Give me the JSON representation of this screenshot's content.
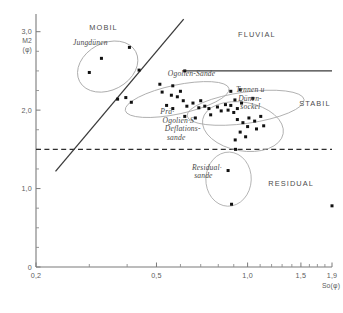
{
  "chart_data": {
    "type": "scatter",
    "title": "",
    "xlabel": "So(φ)",
    "ylabel": "M2 (φ)",
    "xlim": [
      0.2,
      1.9
    ],
    "ylim": [
      0.0,
      3.2
    ],
    "x_scale": "log",
    "grid": false,
    "legend_position": "none",
    "xticks": [
      {
        "value": 0.2,
        "label": "0,2",
        "major": true
      },
      {
        "value": 0.3,
        "label": "",
        "major": false
      },
      {
        "value": 0.4,
        "label": "",
        "major": false
      },
      {
        "value": 0.5,
        "label": "0,5",
        "major": true
      },
      {
        "value": 0.6,
        "label": "",
        "major": false
      },
      {
        "value": 0.7,
        "label": "",
        "major": false
      },
      {
        "value": 0.8,
        "label": "",
        "major": false
      },
      {
        "value": 0.9,
        "label": "",
        "major": false
      },
      {
        "value": 1.0,
        "label": "1,0",
        "major": true
      },
      {
        "value": 1.1,
        "label": "",
        "major": false
      },
      {
        "value": 1.2,
        "label": "",
        "major": false
      },
      {
        "value": 1.3,
        "label": "",
        "major": false
      },
      {
        "value": 1.4,
        "label": "",
        "major": false
      },
      {
        "value": 1.5,
        "label": "1,5",
        "major": true
      },
      {
        "value": 1.6,
        "label": "",
        "major": false
      },
      {
        "value": 1.7,
        "label": "",
        "major": false
      },
      {
        "value": 1.8,
        "label": "",
        "major": false
      },
      {
        "value": 1.9,
        "label": "1,9",
        "major": true
      }
    ],
    "yticks": [
      {
        "value": 0.0,
        "label": "0",
        "major": true
      },
      {
        "value": 0.25,
        "label": "",
        "major": false
      },
      {
        "value": 0.5,
        "label": "",
        "major": false
      },
      {
        "value": 0.75,
        "label": "",
        "major": false
      },
      {
        "value": 1.0,
        "label": "1,0",
        "major": true
      },
      {
        "value": 1.25,
        "label": "",
        "major": false
      },
      {
        "value": 1.5,
        "label": "",
        "major": false
      },
      {
        "value": 1.75,
        "label": "",
        "major": false
      },
      {
        "value": 2.0,
        "label": "2,0",
        "major": true
      },
      {
        "value": 2.25,
        "label": "",
        "major": false
      },
      {
        "value": 2.5,
        "label": "",
        "major": false
      },
      {
        "value": 2.75,
        "label": "",
        "major": false
      },
      {
        "value": 3.0,
        "label": "3,0",
        "major": true
      }
    ],
    "reference_lines": [
      {
        "name": "fluvial-boundary",
        "orientation": "horizontal",
        "style": "solid",
        "y": 2.5,
        "x_start": 0.61,
        "x_end": 1.9
      },
      {
        "name": "residual-boundary",
        "orientation": "horizontal",
        "style": "dashed",
        "y": 1.5,
        "x_start": 0.2,
        "x_end": 1.9
      },
      {
        "name": "mobil-stabil-boundary",
        "orientation": "diagonal",
        "style": "solid",
        "x_start": 0.232,
        "y_start": 1.22,
        "x_end": 0.615,
        "y_end": 3.16
      }
    ],
    "zone_labels": [
      {
        "name": "MOBIL",
        "text": "MOBIL",
        "x": 0.3,
        "y": 3.02
      },
      {
        "name": "FLUVIAL",
        "text": "FLUVIAL",
        "x": 0.93,
        "y": 2.93
      },
      {
        "name": "STABIL",
        "text": "STABIL",
        "x": 1.48,
        "y": 2.05
      },
      {
        "name": "RESIDUAL",
        "text": "RESIDUAL",
        "x": 1.17,
        "y": 1.03
      }
    ],
    "group_labels": [
      {
        "name": "jungduenen",
        "lines": [
          "Jungdünen"
        ],
        "x": 0.265,
        "y": 2.83
      },
      {
        "name": "ogolien-sande",
        "lines": [
          "Ogolien-Sande"
        ],
        "x": 0.545,
        "y": 2.43
      },
      {
        "name": "tennen-duenensockel",
        "lines": [
          "Tennen  u",
          "Dünen-",
          "sockel"
        ],
        "x": 0.915,
        "y": 2.23
      },
      {
        "name": "prae-ogolien-deflationssande",
        "lines": [
          "Prä·",
          "Ogolien·S",
          "Deflations-",
          "sande"
        ],
        "x": 0.515,
        "y": 1.95
      },
      {
        "name": "residualsande",
        "lines": [
          "Residual·",
          "sande"
        ],
        "x": 0.655,
        "y": 1.24
      }
    ],
    "envelopes": [
      {
        "name": "jungduenen-envelope",
        "cx": 0.345,
        "cy": 2.555,
        "rx": 0.105,
        "ry": 0.3,
        "rotation": -28
      },
      {
        "name": "ogolien-sande-envelope",
        "cx": 0.585,
        "cy": 2.135,
        "rx": 0.175,
        "ry": 0.185,
        "rotation": -12
      },
      {
        "name": "tennen-duenensockel-envelope",
        "cx": 0.985,
        "cy": 2.03,
        "rx": 0.195,
        "ry": 0.2,
        "rotation": -8
      },
      {
        "name": "deflationssande-envelope",
        "cx": 0.965,
        "cy": 1.79,
        "rx": 0.135,
        "ry": 0.31,
        "rotation": 10
      },
      {
        "name": "residualsande-envelope",
        "cx": 0.865,
        "cy": 1.12,
        "rx": 0.075,
        "ry": 0.345,
        "rotation": 2
      }
    ],
    "points": [
      {
        "x": 0.329,
        "y": 2.66
      },
      {
        "x": 0.407,
        "y": 2.8
      },
      {
        "x": 0.438,
        "y": 2.51
      },
      {
        "x": 0.3,
        "y": 2.48
      },
      {
        "x": 0.372,
        "y": 2.14
      },
      {
        "x": 0.396,
        "y": 2.16
      },
      {
        "x": 0.413,
        "y": 2.1
      },
      {
        "x": 0.522,
        "y": 2.23
      },
      {
        "x": 0.513,
        "y": 2.33
      },
      {
        "x": 0.566,
        "y": 2.31
      },
      {
        "x": 0.56,
        "y": 2.19
      },
      {
        "x": 0.586,
        "y": 2.17
      },
      {
        "x": 0.6,
        "y": 2.24
      },
      {
        "x": 0.613,
        "y": 2.12
      },
      {
        "x": 0.54,
        "y": 2.06
      },
      {
        "x": 0.566,
        "y": 2.02
      },
      {
        "x": 0.63,
        "y": 2.05
      },
      {
        "x": 0.66,
        "y": 2.09
      },
      {
        "x": 0.69,
        "y": 2.03
      },
      {
        "x": 0.7,
        "y": 2.12
      },
      {
        "x": 0.722,
        "y": 2.05
      },
      {
        "x": 0.745,
        "y": 2.02
      },
      {
        "x": 0.62,
        "y": 1.92
      },
      {
        "x": 0.672,
        "y": 1.9
      },
      {
        "x": 0.755,
        "y": 1.94
      },
      {
        "x": 0.795,
        "y": 2.04
      },
      {
        "x": 0.818,
        "y": 1.99
      },
      {
        "x": 0.845,
        "y": 2.07
      },
      {
        "x": 0.862,
        "y": 2.0
      },
      {
        "x": 0.88,
        "y": 2.06
      },
      {
        "x": 0.9,
        "y": 1.97
      },
      {
        "x": 0.925,
        "y": 2.02
      },
      {
        "x": 0.908,
        "y": 2.13
      },
      {
        "x": 0.955,
        "y": 2.09
      },
      {
        "x": 0.88,
        "y": 2.24
      },
      {
        "x": 0.945,
        "y": 2.26
      },
      {
        "x": 1.04,
        "y": 2.15
      },
      {
        "x": 0.925,
        "y": 1.88
      },
      {
        "x": 0.965,
        "y": 1.84
      },
      {
        "x": 1.01,
        "y": 1.9
      },
      {
        "x": 1.055,
        "y": 1.86
      },
      {
        "x": 1.105,
        "y": 1.92
      },
      {
        "x": 1.0,
        "y": 1.79
      },
      {
        "x": 1.07,
        "y": 1.76
      },
      {
        "x": 1.13,
        "y": 1.8
      },
      {
        "x": 0.945,
        "y": 1.72
      },
      {
        "x": 0.985,
        "y": 1.66
      },
      {
        "x": 0.91,
        "y": 1.62
      },
      {
        "x": 0.912,
        "y": 1.5
      },
      {
        "x": 0.62,
        "y": 2.5
      },
      {
        "x": 0.862,
        "y": 1.23
      },
      {
        "x": 0.885,
        "y": 0.8
      },
      {
        "x": 1.9,
        "y": 0.78
      }
    ]
  }
}
